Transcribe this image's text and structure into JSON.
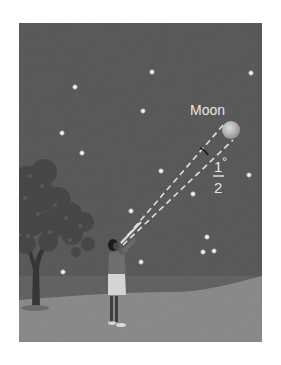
{
  "figure": {
    "frame": {
      "x": 19,
      "y": 23,
      "width": 243,
      "height": 319
    },
    "colors": {
      "sky": "#5b5b5b",
      "ground": "#8c8c8c",
      "star": "#f2f2f2",
      "moon": "#b8b8b8",
      "dashed_line": "#e0e0e0",
      "label": "#e6e6e6",
      "tree_foliage": "#4a4a4a",
      "tree_trunk": "#3a3a3a",
      "person_shorts": "#d4d4d4"
    },
    "moon": {
      "label": "Moon",
      "cx": 231,
      "cy": 130,
      "r": 9
    },
    "angle_label": {
      "numerator": "1",
      "degree": "°",
      "denominator": "2",
      "meaning": "1/2 degree angular diameter"
    },
    "observer": {
      "eye": {
        "x": 121,
        "y": 243
      }
    },
    "stars": [
      {
        "x": 75,
        "y": 87
      },
      {
        "x": 152,
        "y": 72
      },
      {
        "x": 251,
        "y": 73
      },
      {
        "x": 143,
        "y": 111
      },
      {
        "x": 62,
        "y": 133
      },
      {
        "x": 82,
        "y": 153
      },
      {
        "x": 161,
        "y": 171
      },
      {
        "x": 249,
        "y": 175
      },
      {
        "x": 193,
        "y": 194
      },
      {
        "x": 131,
        "y": 211
      },
      {
        "x": 207,
        "y": 237
      },
      {
        "x": 203,
        "y": 252
      },
      {
        "x": 214,
        "y": 251
      },
      {
        "x": 141,
        "y": 262
      },
      {
        "x": 63,
        "y": 272
      }
    ]
  }
}
